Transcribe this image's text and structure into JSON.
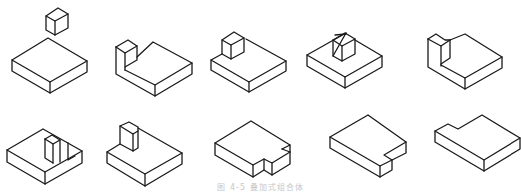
{
  "figure": {
    "caption": "图 4-5  叠加式组合体",
    "stroke_color": "#1a1a1a",
    "background": "#ffffff",
    "rows": [
      {
        "items": [
          {
            "id": "fig-1",
            "description": "slab with separate small cube floating above"
          },
          {
            "id": "fig-2",
            "description": "slab with L-shaped upright at back-left corner"
          },
          {
            "id": "fig-3",
            "description": "slab with small cube on back-left of top"
          },
          {
            "id": "fig-4",
            "description": "slab with small cube centered on top"
          },
          {
            "id": "fig-5",
            "description": "slab with L-shaped upright at back-left corner"
          }
        ]
      },
      {
        "items": [
          {
            "id": "fig-6",
            "description": "slab with notched block cutout on top"
          },
          {
            "id": "fig-7",
            "description": "slab with small cube on back-left"
          },
          {
            "id": "fig-8",
            "description": "slab with notch on front-right corner"
          },
          {
            "id": "fig-9",
            "description": "slab with notch on right edge"
          },
          {
            "id": "fig-10",
            "description": "L-shaped slab with notch on back-left"
          }
        ]
      }
    ]
  }
}
